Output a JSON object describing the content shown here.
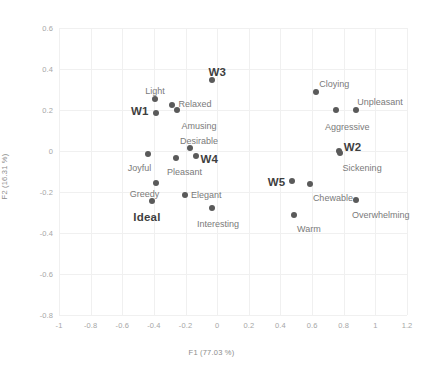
{
  "chart_data": {
    "type": "scatter",
    "title": "",
    "xlabel": "F1 (77.03 %)",
    "ylabel": "F2 (16.31 %)",
    "xlim": [
      -1,
      1.2
    ],
    "ylim": [
      -0.8,
      0.6
    ],
    "xticks": [
      "-1",
      "-0.8",
      "-0.6",
      "-0.4",
      "-0.2",
      "0",
      "0.2",
      "0.4",
      "0.6",
      "0.8",
      "1",
      "1.2"
    ],
    "xtick_values": [
      -1,
      -0.8,
      -0.6,
      -0.4,
      -0.2,
      0,
      0.2,
      0.4,
      0.6,
      0.8,
      1,
      1.2
    ],
    "yticks": [
      "0.6",
      "0.4",
      "0.2",
      "0",
      "-0.2",
      "-0.4",
      "-0.6",
      "-0.8"
    ],
    "ytick_values": [
      0.6,
      0.4,
      0.2,
      0,
      -0.2,
      -0.4,
      -0.6,
      -0.8
    ],
    "grid": true,
    "legend": "none",
    "point_color": "#5a5a5a",
    "label_color": "#7a7a7a",
    "emphasis_label_color": "#3f3f3f",
    "points": [
      {
        "label": "W3",
        "x": -0.03,
        "y": 0.345,
        "bold": true,
        "lx": -0.055,
        "ly": 0.415,
        "anchor": "middle"
      },
      {
        "label": "Light",
        "x": -0.395,
        "y": 0.255,
        "bold": false,
        "lx": -0.455,
        "ly": 0.318,
        "anchor": "start"
      },
      {
        "label": "W1",
        "x": -0.385,
        "y": 0.185,
        "bold": true,
        "lx": -0.545,
        "ly": 0.225,
        "anchor": "start"
      },
      {
        "label": "Relaxed",
        "x": -0.285,
        "y": 0.225,
        "bold": false,
        "lx": -0.245,
        "ly": 0.255,
        "anchor": "start"
      },
      {
        "label": "Amusing",
        "x": -0.255,
        "y": 0.2,
        "bold": false,
        "lx": -0.225,
        "ly": 0.145,
        "anchor": "start"
      },
      {
        "label": "Cloying",
        "x": 0.625,
        "y": 0.288,
        "bold": false,
        "lx": 0.645,
        "ly": 0.352,
        "anchor": "start"
      },
      {
        "label": "Unpleasant",
        "x": 0.875,
        "y": 0.202,
        "bold": false,
        "lx": 0.885,
        "ly": 0.262,
        "anchor": "start"
      },
      {
        "label": "Aggressive",
        "x": 0.748,
        "y": 0.202,
        "bold": false,
        "lx": 0.682,
        "ly": 0.14,
        "anchor": "start"
      },
      {
        "label": "Desirable",
        "x": -0.175,
        "y": 0.015,
        "bold": false,
        "lx": -0.235,
        "ly": 0.075,
        "anchor": "start"
      },
      {
        "label": "Joyful",
        "x": -0.435,
        "y": -0.015,
        "bold": false,
        "lx": -0.565,
        "ly": -0.06,
        "anchor": "start"
      },
      {
        "label": "Pleasant",
        "x": -0.262,
        "y": -0.035,
        "bold": false,
        "lx": -0.318,
        "ly": -0.078,
        "anchor": "start"
      },
      {
        "label": "W4",
        "x": -0.135,
        "y": -0.025,
        "bold": true,
        "lx": -0.105,
        "ly": -0.012,
        "anchor": "start"
      },
      {
        "label": "W2",
        "x": 0.768,
        "y": -0.002,
        "bold": true,
        "lx": 0.8,
        "ly": 0.05,
        "anchor": "start"
      },
      {
        "label": "Sickening",
        "x": 0.775,
        "y": -0.01,
        "bold": false,
        "lx": 0.793,
        "ly": -0.058,
        "anchor": "start"
      },
      {
        "label": "Greedy",
        "x": -0.385,
        "y": -0.155,
        "bold": false,
        "lx": -0.552,
        "ly": -0.185,
        "anchor": "start"
      },
      {
        "label": "W5",
        "x": 0.47,
        "y": -0.145,
        "bold": true,
        "lx": 0.32,
        "ly": -0.122,
        "anchor": "start"
      },
      {
        "label": "Chewable",
        "x": 0.585,
        "y": -0.16,
        "bold": false,
        "lx": 0.605,
        "ly": -0.205,
        "anchor": "start"
      },
      {
        "label": "Elegant",
        "x": -0.205,
        "y": -0.215,
        "bold": false,
        "lx": -0.165,
        "ly": -0.188,
        "anchor": "start"
      },
      {
        "label": "Ideal",
        "x": -0.412,
        "y": -0.245,
        "bold": false,
        "lx": -0.53,
        "ly": -0.295,
        "anchor": "start",
        "bold_ideal": true
      },
      {
        "label": "Overwhelming",
        "x": 0.88,
        "y": -0.238,
        "bold": false,
        "lx": 0.852,
        "ly": -0.288,
        "anchor": "start"
      },
      {
        "label": "Interesting",
        "x": -0.03,
        "y": -0.278,
        "bold": false,
        "lx": -0.128,
        "ly": -0.33,
        "anchor": "start"
      },
      {
        "label": "Warm",
        "x": 0.488,
        "y": -0.31,
        "bold": false,
        "lx": 0.505,
        "ly": -0.355,
        "anchor": "start"
      }
    ]
  }
}
